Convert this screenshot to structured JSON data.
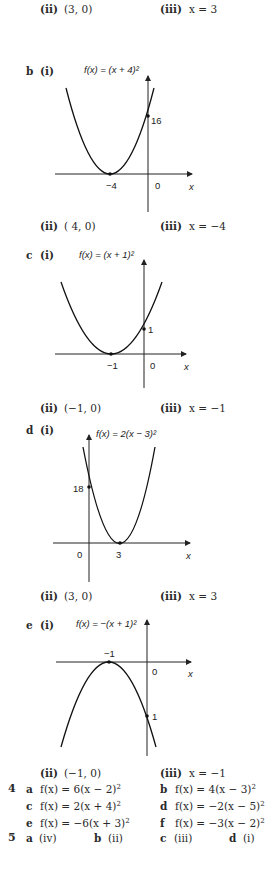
{
  "part_a": {
    "ii_label": "(ii)",
    "ii_value": "(3, 0)",
    "iii_label": "(iii)",
    "iii_value": "x = 3"
  },
  "part_b": {
    "letter": "b",
    "i_label": "(i)",
    "function_label": "f(x) = (x + 4)²",
    "y_intercept_label": "16",
    "vertex_label": "−4",
    "origin_label": "0",
    "x_axis_label": "x",
    "ii_label": "(ii)",
    "ii_value": "( 4, 0)",
    "iii_label": "(iii)",
    "iii_value": "x = −4"
  },
  "part_c": {
    "letter": "c",
    "i_label": "(i)",
    "function_label": "f(x) = (x + 1)²",
    "y_intercept_label": "1",
    "vertex_label": "−1",
    "origin_label": "0",
    "x_axis_label": "x",
    "ii_label": "(ii)",
    "ii_value": "(−1, 0)",
    "iii_label": "(iii)",
    "iii_value": "x = −1"
  },
  "part_d": {
    "letter": "d",
    "i_label": "(i)",
    "function_label": "f(x) = 2(x − 3)²",
    "y_intercept_label": "18",
    "vertex_label": "3",
    "origin_label": "0",
    "x_axis_label": "x",
    "ii_label": "(ii)",
    "ii_value": "(3, 0)",
    "iii_label": "(iii)",
    "iii_value": "x = 3"
  },
  "part_e": {
    "letter": "e",
    "i_label": "(i)",
    "function_label": "f(x) = −(x + 1)²",
    "y_intercept_label": "1",
    "vertex_label": "−1",
    "origin_label": "0",
    "x_axis_label": "x",
    "ii_label": "(ii)",
    "ii_value": "(−1, 0)",
    "iii_label": "(iii)",
    "iii_value": "x = −1"
  },
  "question_4": {
    "number": "4",
    "items": [
      {
        "letter": "a",
        "expr": "f(x) = 6(x − 2)",
        "exp": "2"
      },
      {
        "letter": "b",
        "expr": "f(x) = 4(x − 3)",
        "exp": "2"
      },
      {
        "letter": "c",
        "expr": "f(x) = 2(x + 4)",
        "exp": "2"
      },
      {
        "letter": "d",
        "expr": "f(x) = −2(x − 5)",
        "exp": "2"
      },
      {
        "letter": "e",
        "expr": "f(x) = −6(x + 3)",
        "exp": "2"
      },
      {
        "letter": "f",
        "expr": "f(x) = −3(x − 2)",
        "exp": "2"
      }
    ]
  },
  "question_5": {
    "number": "5",
    "items": [
      {
        "letter": "a",
        "answer": "(iv)"
      },
      {
        "letter": "b",
        "answer": "(ii)"
      },
      {
        "letter": "c",
        "answer": "(iii)"
      },
      {
        "letter": "d",
        "answer": "(i)"
      }
    ]
  }
}
